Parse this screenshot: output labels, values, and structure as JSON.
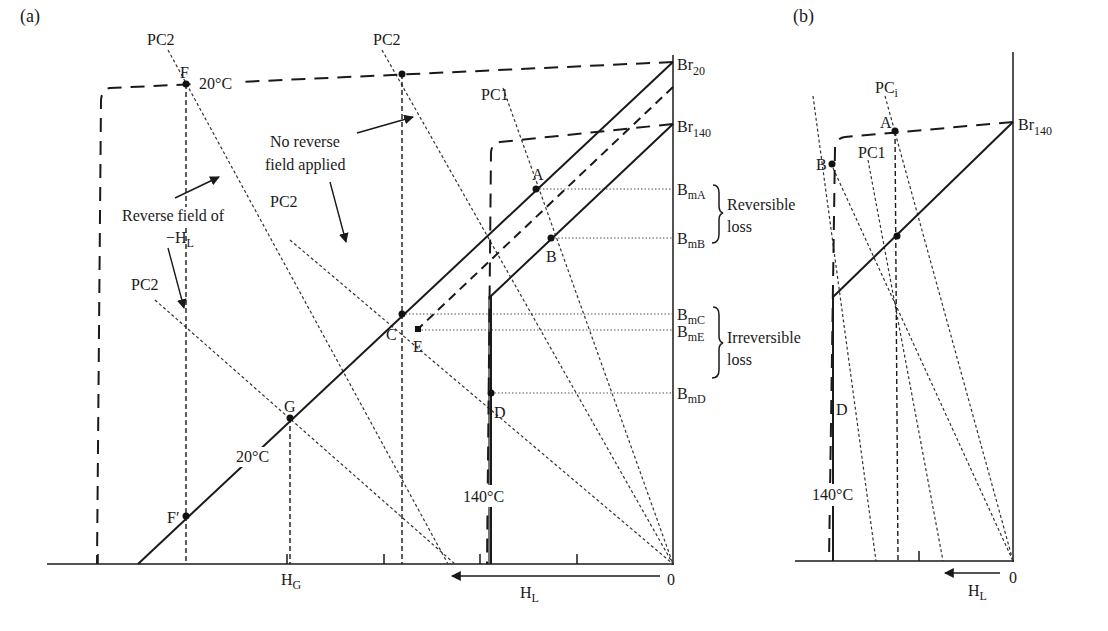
{
  "panel_a": {
    "label": "(a)",
    "y_axis_labels": {
      "br20": {
        "main": "Br",
        "sub": "20"
      },
      "br140": {
        "main": "Br",
        "sub": "140"
      },
      "bma": {
        "main": "B",
        "sub": "mA"
      },
      "bmb": {
        "main": "B",
        "sub": "mB"
      },
      "bmc": {
        "main": "B",
        "sub": "mC"
      },
      "bme": {
        "main": "B",
        "sub": "mE"
      },
      "bmd": {
        "main": "B",
        "sub": "mD"
      }
    },
    "brackets": {
      "reversible": {
        "line1": "Reversible",
        "line2": "loss"
      },
      "irreversible": {
        "line1": "Irreversible",
        "line2": "loss"
      }
    },
    "load_lines": {
      "pc1": "PC1",
      "pc2_top_left": "PC2",
      "pc2_top_mid": "PC2",
      "pc2_mid": "PC2",
      "pc2_left": "PC2"
    },
    "points": {
      "a": "A",
      "b": "B",
      "c": "C",
      "d": "D",
      "e": "E",
      "f": "F",
      "f_prime": "F′",
      "g": "G"
    },
    "temperatures": {
      "t20_top": "20°C",
      "t20_line": "20°C",
      "t140": "140°C"
    },
    "annotations": {
      "no_reverse_line1": "No reverse",
      "no_reverse_line2": "field applied",
      "reverse_line1": "Reverse field of",
      "reverse_line2_main": "−H",
      "reverse_line2_sub": "L"
    },
    "x_axis": {
      "origin": "0",
      "hg_main": "H",
      "hg_sub": "G",
      "hl_main": "H",
      "hl_sub": "L"
    }
  },
  "panel_b": {
    "label": "(b)",
    "y_axis_labels": {
      "br140": {
        "main": "Br",
        "sub": "140"
      }
    },
    "load_lines": {
      "pci_main": "PC",
      "pci_sub": "i",
      "pc1": "PC1"
    },
    "points": {
      "a": "A",
      "b": "B",
      "d": "D"
    },
    "temperatures": {
      "t140": "140°C"
    },
    "x_axis": {
      "origin": "0",
      "hl_main": "H",
      "hl_sub": "L"
    }
  }
}
